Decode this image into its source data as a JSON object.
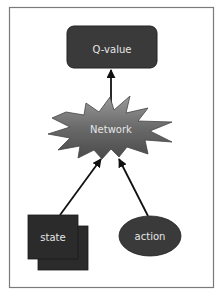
{
  "diagram": {
    "type": "flow",
    "nodes": [
      {
        "id": "q_value",
        "label": "Q-value",
        "shape": "rounded-rectangle",
        "color": "#3a3a3a"
      },
      {
        "id": "network",
        "label": "Network",
        "shape": "starburst",
        "color": "#6e6e6e"
      },
      {
        "id": "state",
        "label": "state",
        "shape": "stacked-squares",
        "color": "#2b2b2b"
      },
      {
        "id": "action",
        "label": "action",
        "shape": "ellipse",
        "color": "#3a3a3a"
      }
    ],
    "edges": [
      {
        "from": "state",
        "to": "network"
      },
      {
        "from": "action",
        "to": "network"
      },
      {
        "from": "network",
        "to": "q_value"
      }
    ],
    "colors": {
      "frame_border": "#7a7a7a",
      "edge": "#111111",
      "label_text": "#e6e6e6"
    }
  }
}
